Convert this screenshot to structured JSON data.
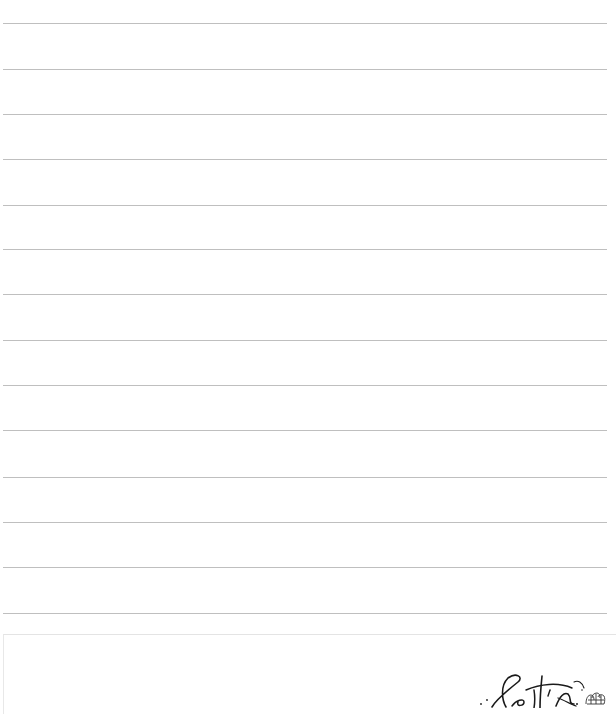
{
  "document": {
    "type": "lined notepaper",
    "ghost_show_through_text": "",
    "rule_count": 14,
    "rules_top_px": [
      23,
      69,
      114,
      159,
      205,
      249,
      294,
      340,
      385,
      430,
      477,
      522,
      567,
      613
    ],
    "rule_color": "#bfbfbf",
    "footer_border_color": "#e4e4e4"
  },
  "footer": {
    "signature_text": "Leitis",
    "signature_icon": "crown-doodle-icon"
  }
}
